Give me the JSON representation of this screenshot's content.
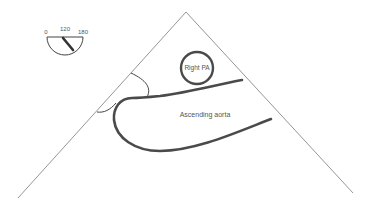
{
  "diagram": {
    "type": "echocardiography-schematic",
    "dial": {
      "label_min": "0",
      "label_mid": "120",
      "label_max": "180",
      "needle_angle_deg": 120
    },
    "labels": {
      "right_pa": "Right PA",
      "ascending_aorta": "Ascending aorta"
    },
    "colors": {
      "background": "#ffffff",
      "sector_line": "#8a8a8a",
      "structure_stroke": "#4a4a4a",
      "text": "#555555"
    }
  }
}
